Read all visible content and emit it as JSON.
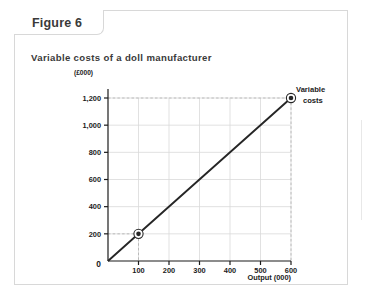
{
  "figure": {
    "tab_label": "Figure 6",
    "subtitle": "Variable costs of a doll manufacturer"
  },
  "colors": {
    "card_border": "#d8d8d8",
    "axis": "#1b1b1b",
    "grid": "#d9d9d9",
    "guide": "#b4b4b4",
    "series": "#262626",
    "text": "#3a3a3a"
  },
  "chart_data": {
    "type": "line",
    "title": "Variable costs of a doll manufacturer",
    "xlabel": "Output (000)",
    "ylabel": "(£000)",
    "x": [
      0,
      600
    ],
    "values": [
      0,
      1200
    ],
    "series": [
      {
        "name": "Variable costs",
        "points": [
          {
            "x": 0,
            "y": 0
          },
          {
            "x": 100,
            "y": 200
          },
          {
            "x": 600,
            "y": 1200
          }
        ]
      }
    ],
    "markers": [
      {
        "x": 100,
        "y": 200
      },
      {
        "x": 600,
        "y": 1200
      }
    ],
    "guides": [
      {
        "x": 100,
        "y": 200
      },
      {
        "x": 600,
        "y": 1200
      }
    ],
    "xticks": [
      0,
      100,
      200,
      300,
      400,
      500,
      600
    ],
    "xtick_labels": [
      "0",
      "100",
      "200",
      "300",
      "400",
      "500",
      "600"
    ],
    "yticks": [
      0,
      200,
      400,
      600,
      800,
      1000,
      1200
    ],
    "ytick_labels": [
      "0",
      "200",
      "400",
      "600",
      "800",
      "1,000",
      "1,200"
    ],
    "xlim": [
      0,
      600
    ],
    "ylim": [
      0,
      1200
    ],
    "grid": true,
    "legend": "inline-right",
    "legend_entries": [
      "Variable",
      "costs"
    ]
  }
}
